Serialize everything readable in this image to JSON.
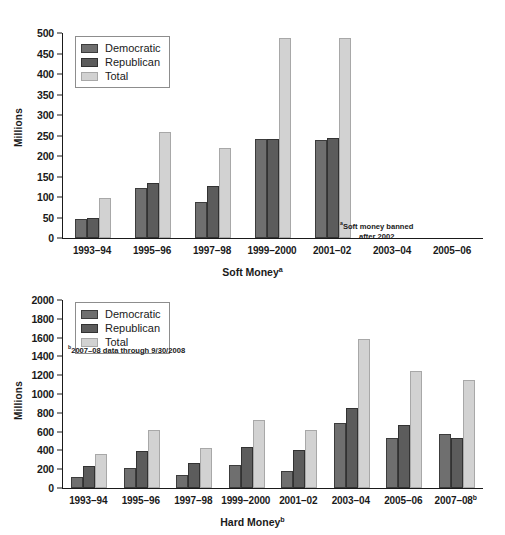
{
  "chart_data": [
    {
      "id": "soft-money",
      "type": "bar",
      "title": "Soft Money",
      "title_superscript": "a",
      "xlabel": "Soft Money",
      "ylabel": "Millions",
      "ylim": [
        0,
        500
      ],
      "ytick_step": 50,
      "yticks": [
        "0",
        "50",
        "100",
        "150",
        "200",
        "250",
        "300",
        "350",
        "400",
        "450",
        "500"
      ],
      "grid": false,
      "legend_position": "top-left",
      "categories": [
        "1993–94",
        "1995–96",
        "1997–98",
        "1999–2000",
        "2001–02",
        "2003–04",
        "2005–06"
      ],
      "series": [
        {
          "name": "Democratic",
          "color": "#6f6f6f",
          "values": [
            46,
            121,
            88,
            241,
            238,
            null,
            null
          ]
        },
        {
          "name": "Republican",
          "color": "#5c5c5c",
          "values": [
            49,
            133,
            126,
            242,
            244,
            null,
            null
          ]
        },
        {
          "name": "Total",
          "color": "#d2d2d2",
          "values": [
            98,
            259,
            220,
            487,
            488,
            null,
            null
          ]
        }
      ],
      "annotations": [
        {
          "text": "Soft money banned",
          "superscript": "a"
        },
        {
          "text": "after 2002"
        }
      ]
    },
    {
      "id": "hard-money",
      "type": "bar",
      "title": "Hard Money",
      "title_superscript": "b",
      "xlabel": "Hard Money",
      "ylabel": "Millions",
      "ylim": [
        0,
        2000
      ],
      "ytick_step": 200,
      "yticks": [
        "0",
        "200",
        "400",
        "600",
        "800",
        "1000",
        "1200",
        "1400",
        "1600",
        "1800",
        "2000"
      ],
      "grid": false,
      "legend_position": "top-left",
      "categories": [
        "1993–94",
        "1995–96",
        "1997–98",
        "1999–2000",
        "2001–02",
        "2003–04",
        "2005–06",
        "2007–08"
      ],
      "last_category_superscript": "b",
      "series": [
        {
          "name": "Democratic",
          "color": "#6f6f6f",
          "values": [
            121,
            208,
            140,
            250,
            180,
            690,
            527,
            572
          ]
        },
        {
          "name": "Republican",
          "color": "#5c5c5c",
          "values": [
            234,
            398,
            263,
            434,
            408,
            851,
            671,
            532
          ]
        },
        {
          "name": "Total",
          "color": "#d2d2d2",
          "values": [
            363,
            620,
            422,
            723,
            617,
            1583,
            1246,
            1152
          ]
        }
      ],
      "annotations": [
        {
          "text": "2007–08 data through 9/30/2008",
          "superscript": "b"
        }
      ]
    }
  ],
  "legend": {
    "items": [
      {
        "label": "Democratic",
        "color": "#6f6f6f"
      },
      {
        "label": "Republican",
        "color": "#5c5c5c"
      },
      {
        "label": "Total",
        "color": "#d2d2d2"
      }
    ]
  }
}
